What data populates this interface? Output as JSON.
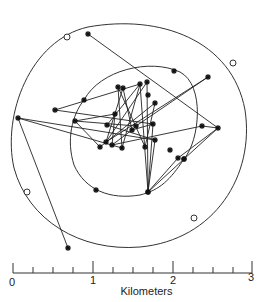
{
  "scale": {
    "title": "Kilometers",
    "tick_labels": [
      "0",
      "1",
      "2",
      "3"
    ],
    "unit": "km",
    "range": [
      0,
      3
    ],
    "minor_step": 0.25
  },
  "chart_data": {
    "type": "scatter",
    "title": "",
    "xlabel": "Kilometers",
    "ylabel": "",
    "outer_boundary_markers": [
      [
        67,
        37
      ],
      [
        233,
        63
      ],
      [
        27,
        192
      ],
      [
        194,
        218
      ]
    ],
    "inner_boundary_markers": [
      [
        84,
        100
      ],
      [
        174,
        71
      ],
      [
        96,
        190
      ],
      [
        148,
        192
      ],
      [
        184,
        159
      ]
    ],
    "points": [
      [
        88,
        34
      ],
      [
        18,
        118
      ],
      [
        55,
        110
      ],
      [
        75,
        121
      ],
      [
        118,
        87
      ],
      [
        140,
        84
      ],
      [
        148,
        95
      ],
      [
        155,
        103
      ],
      [
        147,
        82
      ],
      [
        153,
        124
      ],
      [
        155,
        140
      ],
      [
        170,
        150
      ],
      [
        184,
        159
      ],
      [
        148,
        192
      ],
      [
        107,
        125
      ],
      [
        106,
        142
      ],
      [
        100,
        147
      ],
      [
        112,
        145
      ],
      [
        122,
        148
      ],
      [
        132,
        130
      ],
      [
        145,
        147
      ],
      [
        123,
        88
      ],
      [
        115,
        114
      ],
      [
        136,
        126
      ],
      [
        208,
        77
      ],
      [
        218,
        128
      ],
      [
        202,
        126
      ],
      [
        68,
        248
      ],
      [
        178,
        158
      ]
    ],
    "track_order": [
      [
        88,
        34
      ],
      [
        218,
        128
      ],
      [
        178,
        158
      ],
      [
        148,
        192
      ],
      [
        140,
        84
      ],
      [
        122,
        148
      ],
      [
        118,
        87
      ],
      [
        145,
        147
      ],
      [
        155,
        103
      ],
      [
        100,
        147
      ],
      [
        75,
        121
      ],
      [
        136,
        126
      ],
      [
        208,
        77
      ],
      [
        106,
        142
      ],
      [
        147,
        82
      ],
      [
        148,
        192
      ],
      [
        184,
        159
      ],
      [
        218,
        128
      ],
      [
        202,
        126
      ],
      [
        112,
        145
      ],
      [
        132,
        130
      ],
      [
        153,
        124
      ],
      [
        55,
        110
      ],
      [
        140,
        84
      ],
      [
        107,
        125
      ],
      [
        155,
        140
      ],
      [
        18,
        118
      ],
      [
        122,
        148
      ],
      [
        68,
        248
      ]
    ]
  }
}
